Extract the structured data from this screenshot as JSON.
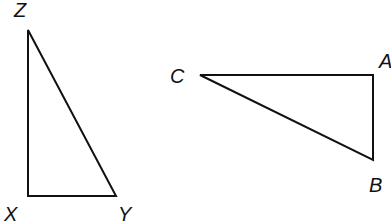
{
  "triangles": [
    {
      "name": "XYZ",
      "vertices": [
        {
          "label": "Z",
          "x": 28,
          "y": 30
        },
        {
          "label": "X",
          "x": 28,
          "y": 196
        },
        {
          "label": "Y",
          "x": 116,
          "y": 196
        }
      ],
      "right_angle_at": "X"
    },
    {
      "name": "ABC",
      "vertices": [
        {
          "label": "C",
          "x": 200,
          "y": 75
        },
        {
          "label": "A",
          "x": 373,
          "y": 75
        },
        {
          "label": "B",
          "x": 373,
          "y": 160
        }
      ],
      "right_angle_at": "A"
    }
  ],
  "labels": {
    "Z": "Z",
    "X": "X",
    "Y": "Y",
    "C": "C",
    "A": "A",
    "B": "B"
  }
}
